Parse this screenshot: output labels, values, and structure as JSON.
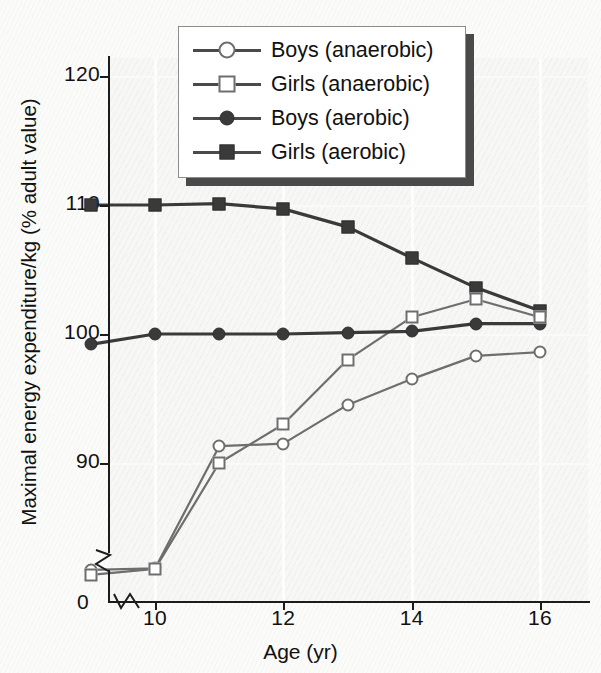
{
  "chart_data": {
    "type": "line",
    "title": "",
    "xlabel": "Age (yr)",
    "ylabel": "Maximal energy expenditure/kg (% adult value)",
    "x": [
      9,
      10,
      11,
      12,
      13,
      14,
      15,
      16
    ],
    "xlim": [
      8.6,
      16.6
    ],
    "ylim": [
      88.5,
      122
    ],
    "xticks": [
      10,
      12,
      14,
      16
    ],
    "xtick_labels": [
      "10",
      "12",
      "14",
      "16"
    ],
    "yticks": [
      90,
      100,
      110,
      120
    ],
    "ytick_labels": [
      "90",
      "100",
      "110",
      "120"
    ],
    "y_axis_break": true,
    "y_origin_label": "0",
    "grid": "faint-vertical",
    "legend_position": "top-center",
    "series": [
      {
        "name": "Boys (anaerobic)",
        "marker": "circle-open",
        "color": "#6e6e6e",
        "values": [
          86.3,
          86.6,
          91.3,
          91.5,
          94.5,
          96.5,
          98.3,
          98.6
        ],
        "broken_points": [
          9,
          10
        ]
      },
      {
        "name": "Girls (anaerobic)",
        "marker": "square-open",
        "color": "#6e6e6e",
        "values": [
          85.2,
          86.5,
          90.0,
          93.0,
          98.0,
          101.3,
          102.7,
          101.3
        ],
        "broken_points": [
          9,
          10
        ]
      },
      {
        "name": "Boys (aerobic)",
        "marker": "circle-fill",
        "color": "#3a3a3a",
        "values": [
          99.2,
          100.0,
          100.0,
          100.0,
          100.1,
          100.2,
          100.8,
          100.8
        ],
        "broken_points": []
      },
      {
        "name": "Girls (aerobic)",
        "marker": "square-fill",
        "color": "#3a3a3a",
        "values": [
          110.0,
          110.0,
          110.1,
          109.7,
          108.3,
          105.9,
          103.6,
          101.8
        ],
        "broken_points": []
      }
    ]
  },
  "legend": {
    "entries": [
      {
        "label": "Boys (anaerobic)",
        "marker": "circle-open"
      },
      {
        "label": "Girls (anaerobic)",
        "marker": "square-open"
      },
      {
        "label": "Boys (aerobic)",
        "marker": "circle-fill"
      },
      {
        "label": "Girls (aerobic)",
        "marker": "square-fill"
      }
    ]
  }
}
